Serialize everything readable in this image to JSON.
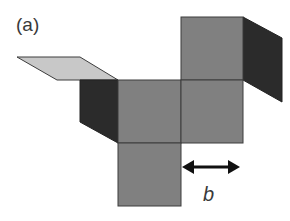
{
  "figure": {
    "panel_label": "(a)",
    "dimension_label": "b"
  },
  "colors": {
    "face": "#808080",
    "face_outline": "#3c3c3c",
    "dark_flap": "#2b2b2b",
    "light_flap": "#c8c8c8",
    "arrow": "#111111",
    "text": "#3a3a3a",
    "background": "#ffffff"
  },
  "shapes": {
    "squares": [
      "top-right",
      "middle-left",
      "middle-right",
      "bottom"
    ],
    "flaps": [
      "light-flap-left",
      "dark-flap-left",
      "dark-flap-right"
    ],
    "arrow": "double-headed horizontal arrow"
  }
}
